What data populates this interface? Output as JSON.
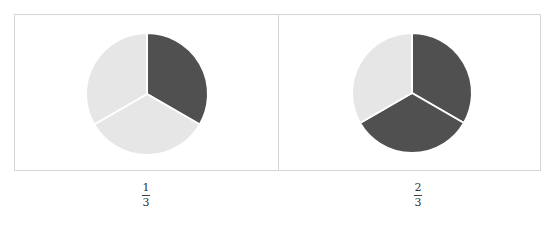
{
  "chart_data": [
    {
      "type": "pie",
      "title": "",
      "categories": [
        "Part 1",
        "Part 2",
        "Part 3"
      ],
      "values": [
        1,
        1,
        1
      ],
      "shaded": [
        true,
        false,
        false
      ],
      "colors": [
        "#505050",
        "#e6e6e6",
        "#e6e6e6"
      ],
      "caption": {
        "numerator": "1",
        "denominator": "3"
      }
    },
    {
      "type": "pie",
      "title": "",
      "categories": [
        "Part 1",
        "Part 2",
        "Part 3"
      ],
      "values": [
        1,
        1,
        1
      ],
      "shaded": [
        true,
        true,
        false
      ],
      "colors": [
        "#505050",
        "#505050",
        "#e6e6e6"
      ],
      "caption": {
        "numerator": "2",
        "denominator": "3"
      }
    }
  ],
  "figures": [
    {
      "numerator": "1",
      "denominator": "3"
    },
    {
      "numerator": "2",
      "denominator": "3"
    }
  ]
}
